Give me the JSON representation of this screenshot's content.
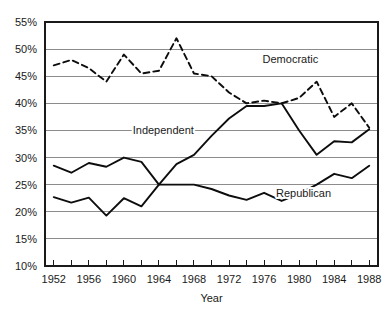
{
  "chart_data": {
    "type": "line",
    "title": "",
    "xlabel": "Year",
    "ylabel": "",
    "xlim": [
      1951,
      1989
    ],
    "ylim": [
      10,
      55
    ],
    "grid": true,
    "legend_position": "inline-annotations",
    "x": [
      1952,
      1954,
      1956,
      1958,
      1960,
      1962,
      1964,
      1966,
      1968,
      1970,
      1972,
      1974,
      1976,
      1978,
      1980,
      1982,
      1984,
      1986,
      1988
    ],
    "xticks_major": [
      1952,
      1956,
      1960,
      1964,
      1968,
      1972,
      1976,
      1980,
      1984,
      1988
    ],
    "xticks_minor": [
      1954,
      1958,
      1962,
      1966,
      1970,
      1974,
      1978,
      1982,
      1986
    ],
    "yticks": [
      10,
      15,
      20,
      25,
      30,
      35,
      40,
      45,
      50,
      55
    ],
    "ytick_labels": [
      "10%",
      "15%",
      "20%",
      "25%",
      "30%",
      "35%",
      "40%",
      "45%",
      "50%",
      "55%"
    ],
    "xtick_labels": [
      "1952",
      "1956",
      "1960",
      "1964",
      "1968",
      "1972",
      "1976",
      "1980",
      "1984",
      "1988"
    ],
    "series": [
      {
        "name": "Democratic",
        "style": "dashed",
        "color": "#0d0d0d",
        "label_x": 1979,
        "label_y": 47.4,
        "values": [
          47.0,
          48.0,
          46.5,
          44.0,
          49.0,
          45.5,
          46.0,
          52.0,
          45.5,
          45.0,
          42.0,
          40.0,
          40.5,
          40.0,
          41.0,
          44.0,
          37.5,
          40.0,
          35.5
        ]
      },
      {
        "name": "Independent",
        "style": "solid",
        "color": "#0d0d0d",
        "label_x": 1964.5,
        "label_y": 34.3,
        "values": [
          28.5,
          27.2,
          29.0,
          28.3,
          30.0,
          29.2,
          25.0,
          28.8,
          30.5,
          34.0,
          37.2,
          39.5,
          39.5,
          40.0,
          35.0,
          30.5,
          33.0,
          32.8,
          35.2
        ]
      },
      {
        "name": "Republican",
        "style": "solid",
        "color": "#0d0d0d",
        "label_x": 1980.5,
        "label_y": 22.8,
        "values": [
          22.7,
          21.7,
          22.6,
          19.3,
          22.5,
          21.0,
          25.0,
          25.0,
          25.0,
          24.2,
          23.0,
          22.2,
          23.5,
          22.0,
          23.3,
          25.0,
          27.0,
          26.2,
          28.5
        ]
      }
    ]
  },
  "axis": {
    "x_title": "Year"
  }
}
